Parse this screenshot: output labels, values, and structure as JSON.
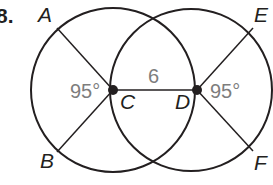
{
  "problem_number": "8.",
  "colors": {
    "stroke": "#231f20",
    "measure_text": "#7d7d7d",
    "background": "#ffffff"
  },
  "points": {
    "A": {
      "label": "A"
    },
    "B": {
      "label": "B"
    },
    "C": {
      "label": "C"
    },
    "D": {
      "label": "D"
    },
    "E": {
      "label": "E"
    },
    "F": {
      "label": "F"
    }
  },
  "measures": {
    "segment_CD": "6",
    "angle_C": "95°",
    "angle_D": "95°"
  }
}
